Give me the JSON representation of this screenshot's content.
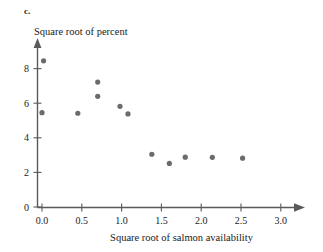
{
  "figure": {
    "part_label": "c.",
    "y_axis_title": "Square root of percent",
    "x_axis_title": "Square root of salmon availability",
    "point_color": "#6b6b6b",
    "axis_color": "#5a5a5a",
    "background": "#ffffff"
  },
  "chart_data": {
    "type": "scatter",
    "title": "",
    "xlabel": "Square root of salmon availability",
    "ylabel": "Square root of percent",
    "xlim": [
      0.0,
      3.0
    ],
    "ylim": [
      0.0,
      9.0
    ],
    "xticks": [
      "0.0",
      "0.5",
      "1.0",
      "1.5",
      "2.0",
      "2.5",
      "3.0"
    ],
    "xtick_values": [
      0.0,
      0.5,
      1.0,
      1.5,
      2.0,
      2.5,
      3.0
    ],
    "yticks": [
      "0",
      "2",
      "4",
      "6",
      "8"
    ],
    "ytick_values": [
      0,
      2,
      4,
      6,
      8
    ],
    "grid": false,
    "legend": false,
    "marker": "circle",
    "points": [
      {
        "x": 0.02,
        "y": 8.45
      },
      {
        "x": 0.0,
        "y": 5.45
      },
      {
        "x": 0.45,
        "y": 5.42
      },
      {
        "x": 0.7,
        "y": 7.22
      },
      {
        "x": 0.7,
        "y": 6.4
      },
      {
        "x": 0.98,
        "y": 5.82
      },
      {
        "x": 1.08,
        "y": 5.38
      },
      {
        "x": 1.38,
        "y": 3.05
      },
      {
        "x": 1.6,
        "y": 2.52
      },
      {
        "x": 1.8,
        "y": 2.88
      },
      {
        "x": 2.14,
        "y": 2.87
      },
      {
        "x": 2.52,
        "y": 2.82
      }
    ]
  }
}
